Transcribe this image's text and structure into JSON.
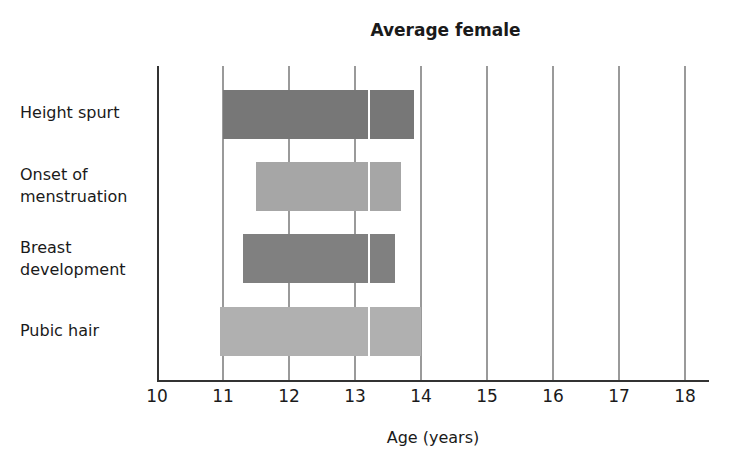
{
  "chart_data": {
    "type": "bar",
    "orientation": "horizontal",
    "title": "Average female",
    "xlabel": "Age (years)",
    "ylabel": "",
    "xlim": [
      10,
      18
    ],
    "x_ticks": [
      "10",
      "11",
      "12",
      "13",
      "14",
      "15",
      "16",
      "17",
      "18"
    ],
    "grid": true,
    "categories": [
      "Height spurt",
      "Onset of menstruation",
      "Breast development",
      "Pubic hair"
    ],
    "series": [
      {
        "name": "Height spurt",
        "start": 11.0,
        "end": 13.9,
        "marker": 13.2,
        "color": "#777777"
      },
      {
        "name": "Onset of menstruation",
        "start": 11.5,
        "end": 13.7,
        "marker": 13.2,
        "color": "#a6a6a6"
      },
      {
        "name": "Breast development",
        "start": 11.3,
        "end": 13.6,
        "marker": 13.2,
        "color": "#808080"
      },
      {
        "name": "Pubic hair",
        "start": 10.95,
        "end": 14.0,
        "marker": 13.2,
        "color": "#b0b0b0"
      }
    ]
  },
  "labels": {
    "height": [
      "Height spurt"
    ],
    "menstruation": [
      "Onset of",
      "menstruation"
    ],
    "breast": [
      "Breast",
      "development"
    ],
    "pubic": [
      "Pubic hair"
    ]
  }
}
